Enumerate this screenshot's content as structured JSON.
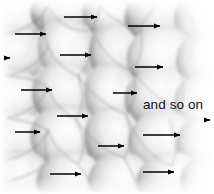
{
  "figure": {
    "width": 214,
    "height": 194,
    "background_color": "#ffffff",
    "style": "grayscale shaded cell mosaic, teardrop blobs, dark edges fading to light centers, right side fading to white"
  },
  "annotations": [
    {
      "id": "and-so-on-label",
      "text": "and so on",
      "x": 143,
      "y": 98,
      "font_size": 13.5,
      "color": "#111111"
    }
  ],
  "arrows": {
    "color": "#000000",
    "direction": "right",
    "count": 15,
    "items": [
      {
        "id": "arrow-1",
        "x1": 64,
        "y1": 17,
        "x2": 97,
        "y2": 17
      },
      {
        "id": "arrow-2",
        "x1": 15,
        "y1": 34,
        "x2": 46,
        "y2": 34
      },
      {
        "id": "arrow-3",
        "x1": 128,
        "y1": 26,
        "x2": 160,
        "y2": 26
      },
      {
        "id": "arrow-4",
        "x1": 60,
        "y1": 55,
        "x2": 91,
        "y2": 55
      },
      {
        "id": "arrow-5",
        "x1": 135,
        "y1": 67,
        "x2": 163,
        "y2": 67
      },
      {
        "id": "arrow-6",
        "x1": 21,
        "y1": 90,
        "x2": 52,
        "y2": 90
      },
      {
        "id": "arrow-7",
        "x1": 113,
        "y1": 93,
        "x2": 137,
        "y2": 93
      },
      {
        "id": "arrow-8",
        "x1": 57,
        "y1": 116,
        "x2": 88,
        "y2": 116
      },
      {
        "id": "arrow-9",
        "x1": 15,
        "y1": 132,
        "x2": 40,
        "y2": 132
      },
      {
        "id": "arrow-10",
        "x1": 143,
        "y1": 135,
        "x2": 180,
        "y2": 135
      },
      {
        "id": "arrow-11",
        "x1": 98,
        "y1": 146,
        "x2": 124,
        "y2": 146
      },
      {
        "id": "arrow-12",
        "x1": 50,
        "y1": 174,
        "x2": 81,
        "y2": 174
      },
      {
        "id": "arrow-13",
        "x1": 143,
        "y1": 172,
        "x2": 174,
        "y2": 172
      },
      {
        "id": "arrow-14",
        "x1": 6,
        "y1": 58,
        "x2": 10,
        "y2": 58
      },
      {
        "id": "arrow-15",
        "x1": 206,
        "y1": 120,
        "x2": 210,
        "y2": 120
      }
    ]
  },
  "cells": [
    {
      "cx": 18,
      "cy": 18,
      "rx": 30,
      "ry": 26,
      "rot": -18
    },
    {
      "cx": 62,
      "cy": 12,
      "rx": 30,
      "ry": 24,
      "rot": -10
    },
    {
      "cx": 112,
      "cy": 14,
      "rx": 26,
      "ry": 22,
      "rot": -5
    },
    {
      "cx": 158,
      "cy": 16,
      "rx": 32,
      "ry": 26,
      "rot": -12
    },
    {
      "cx": 200,
      "cy": 20,
      "rx": 26,
      "ry": 26,
      "rot": 0
    },
    {
      "cx": 16,
      "cy": 56,
      "rx": 30,
      "ry": 28,
      "rot": -20
    },
    {
      "cx": 68,
      "cy": 52,
      "rx": 28,
      "ry": 32,
      "rot": -12
    },
    {
      "cx": 116,
      "cy": 55,
      "rx": 24,
      "ry": 28,
      "rot": -8
    },
    {
      "cx": 160,
      "cy": 58,
      "rx": 32,
      "ry": 28,
      "rot": -14
    },
    {
      "cx": 202,
      "cy": 62,
      "rx": 26,
      "ry": 26,
      "rot": 0
    },
    {
      "cx": 14,
      "cy": 98,
      "rx": 30,
      "ry": 28,
      "rot": -20
    },
    {
      "cx": 64,
      "cy": 96,
      "rx": 30,
      "ry": 30,
      "rot": -10
    },
    {
      "cx": 112,
      "cy": 96,
      "rx": 26,
      "ry": 30,
      "rot": -6
    },
    {
      "cx": 158,
      "cy": 100,
      "rx": 32,
      "ry": 28,
      "rot": -14
    },
    {
      "cx": 18,
      "cy": 140,
      "rx": 30,
      "ry": 28,
      "rot": -18
    },
    {
      "cx": 66,
      "cy": 138,
      "rx": 32,
      "ry": 30,
      "rot": -8
    },
    {
      "cx": 114,
      "cy": 140,
      "rx": 28,
      "ry": 30,
      "rot": -6
    },
    {
      "cx": 162,
      "cy": 142,
      "rx": 32,
      "ry": 28,
      "rot": -12
    },
    {
      "cx": 20,
      "cy": 178,
      "rx": 30,
      "ry": 26,
      "rot": -16
    },
    {
      "cx": 70,
      "cy": 180,
      "rx": 32,
      "ry": 26,
      "rot": -8
    },
    {
      "cx": 120,
      "cy": 180,
      "rx": 30,
      "ry": 26,
      "rot": -6
    },
    {
      "cx": 168,
      "cy": 180,
      "rx": 32,
      "ry": 26,
      "rot": -10
    }
  ]
}
